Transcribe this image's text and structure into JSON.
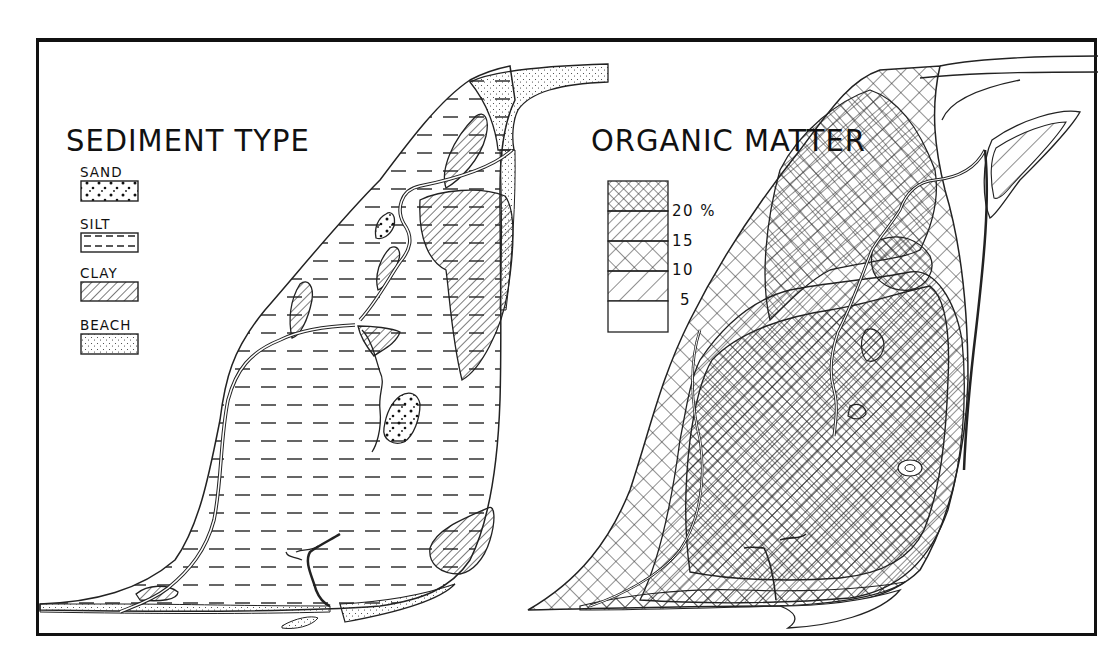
{
  "figure": {
    "type": "thematic-map-pair",
    "background": "#ffffff",
    "ink": "#111111"
  },
  "sediment_panel": {
    "title": "SEDIMENT TYPE",
    "legend": [
      {
        "label": "SAND",
        "pattern": "coarse-dots"
      },
      {
        "label": "SILT",
        "pattern": "dashed-horizontal-lines"
      },
      {
        "label": "CLAY",
        "pattern": "diagonal-hatch"
      },
      {
        "label": "BEACH",
        "pattern": "fine-stipple"
      }
    ]
  },
  "organic_panel": {
    "title": "ORGANIC MATTER",
    "legend": {
      "unit": "%",
      "breaks": [
        "20 %",
        "15",
        "10",
        "5"
      ],
      "classes": [
        {
          "range": ">20",
          "pattern": "fine-crosshatch"
        },
        {
          "range": "15-20",
          "pattern": "diagonal-hatch"
        },
        {
          "range": "10-15",
          "pattern": "coarse-crosshatch"
        },
        {
          "range": "5-10",
          "pattern": "coarse-diagonal-hatch"
        },
        {
          "range": "<5",
          "pattern": "none"
        }
      ]
    }
  }
}
